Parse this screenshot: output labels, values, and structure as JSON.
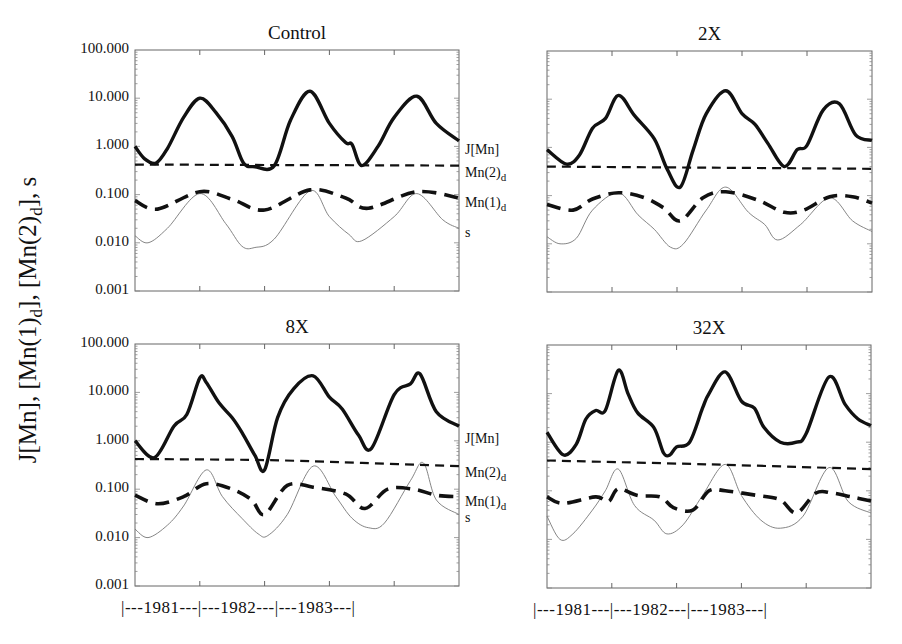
{
  "chart_data": {
    "type": "line",
    "layout": "2x2 panels, shared log y-axis, shared time x-axis",
    "ylabel": "J[Mn], [Mn(1)d], [Mn(2)d], s",
    "yscale": "log",
    "ylim": [
      0.001,
      100
    ],
    "yticks": [
      "100.000",
      "10.000",
      "1.000",
      "0.100",
      "0.010",
      "0.001"
    ],
    "ytick_values": [
      100,
      10,
      1,
      0.1,
      0.01,
      0.001
    ],
    "xlabel_segments": [
      "|---1981---",
      "|---1982---",
      "|---1983---|"
    ],
    "x_years": [
      "1981",
      "1982",
      "1983"
    ],
    "x_note": "x is fraction of the 1981–1983 span (0 = start, 1 = end)",
    "grid": false,
    "legend_position": "right edge labels at line ends",
    "series_styles": {
      "J[Mn]": "thick solid",
      "Mn(2)d": "medium dashed",
      "Mn(1)d": "thick long-dashed",
      "s": "thin solid gray"
    },
    "panels": [
      {
        "title": "Control",
        "labels": [
          "J[Mn]",
          "Mn(2)d",
          "Mn(1)d",
          "s"
        ],
        "series": [
          {
            "name": "J[Mn]",
            "x": [
              0,
              0.03,
              0.065,
              0.1,
              0.15,
              0.2,
              0.25,
              0.3,
              0.335,
              0.37,
              0.43,
              0.48,
              0.54,
              0.6,
              0.65,
              0.67,
              0.7,
              0.75,
              0.8,
              0.87,
              0.93,
              1.0
            ],
            "values": [
              1.0,
              0.55,
              0.45,
              0.9,
              4.0,
              10.0,
              5.0,
              1.6,
              0.45,
              0.38,
              0.4,
              3.5,
              14.0,
              3.0,
              1.2,
              1.1,
              0.4,
              1.0,
              4.0,
              11.0,
              3.0,
              1.3
            ]
          },
          {
            "name": "Mn(2)d",
            "x": [
              0,
              0.5,
              1.0
            ],
            "values": [
              0.42,
              0.41,
              0.4
            ]
          },
          {
            "name": "Mn(1)d",
            "x": [
              0,
              0.07,
              0.2,
              0.3,
              0.4,
              0.54,
              0.65,
              0.72,
              0.87,
              1.0
            ],
            "values": [
              0.075,
              0.05,
              0.115,
              0.08,
              0.048,
              0.125,
              0.085,
              0.052,
              0.115,
              0.085
            ]
          },
          {
            "name": "s",
            "x": [
              0,
              0.04,
              0.1,
              0.2,
              0.28,
              0.33,
              0.37,
              0.43,
              0.54,
              0.6,
              0.66,
              0.7,
              0.8,
              0.87,
              0.95,
              1.0
            ],
            "values": [
              0.014,
              0.01,
              0.02,
              0.105,
              0.025,
              0.0085,
              0.008,
              0.012,
              0.12,
              0.035,
              0.015,
              0.011,
              0.035,
              0.105,
              0.03,
              0.02
            ]
          }
        ]
      },
      {
        "title": "2X",
        "labels": [],
        "series": [
          {
            "name": "J[Mn]",
            "x": [
              0,
              0.06,
              0.1,
              0.14,
              0.18,
              0.22,
              0.27,
              0.33,
              0.37,
              0.41,
              0.45,
              0.49,
              0.55,
              0.6,
              0.64,
              0.68,
              0.73,
              0.77,
              0.8,
              0.85,
              0.9,
              0.95,
              1.0
            ],
            "values": [
              0.9,
              0.45,
              0.7,
              2.5,
              4.0,
              12.0,
              4.5,
              1.5,
              0.35,
              0.15,
              0.9,
              5.0,
              15.0,
              5.0,
              3.0,
              1.2,
              0.4,
              0.9,
              1.1,
              6.0,
              8.0,
              1.8,
              1.4
            ]
          },
          {
            "name": "Mn(2)d",
            "x": [
              0,
              0.5,
              1.0
            ],
            "values": [
              0.4,
              0.38,
              0.36
            ]
          },
          {
            "name": "Mn(1)d",
            "x": [
              0,
              0.08,
              0.14,
              0.22,
              0.3,
              0.36,
              0.41,
              0.48,
              0.55,
              0.65,
              0.73,
              0.79,
              0.87,
              0.94,
              1.0
            ],
            "values": [
              0.065,
              0.05,
              0.085,
              0.115,
              0.09,
              0.055,
              0.03,
              0.09,
              0.12,
              0.08,
              0.045,
              0.05,
              0.095,
              0.095,
              0.07
            ]
          },
          {
            "name": "s",
            "x": [
              0,
              0.04,
              0.09,
              0.14,
              0.22,
              0.28,
              0.33,
              0.38,
              0.42,
              0.49,
              0.55,
              0.62,
              0.67,
              0.71,
              0.78,
              0.87,
              0.94,
              1.0
            ],
            "values": [
              0.014,
              0.01,
              0.013,
              0.05,
              0.115,
              0.04,
              0.02,
              0.0085,
              0.01,
              0.05,
              0.15,
              0.045,
              0.025,
              0.012,
              0.025,
              0.09,
              0.03,
              0.018
            ]
          }
        ]
      },
      {
        "title": "8X",
        "labels": [
          "J[Mn]",
          "Mn(2)d",
          "Mn(1)d",
          "s"
        ],
        "series": [
          {
            "name": "J[Mn]",
            "x": [
              0,
              0.06,
              0.12,
              0.16,
              0.2,
              0.22,
              0.26,
              0.3,
              0.33,
              0.37,
              0.4,
              0.44,
              0.49,
              0.55,
              0.6,
              0.64,
              0.69,
              0.73,
              0.8,
              0.85,
              0.88,
              0.93,
              1.0
            ],
            "values": [
              1.0,
              0.45,
              2.0,
              3.5,
              20.0,
              16.0,
              6.0,
              3.0,
              1.5,
              0.5,
              0.25,
              3.0,
              12.0,
              22.0,
              8.0,
              4.5,
              1.3,
              0.7,
              9.0,
              15.0,
              24.0,
              4.0,
              2.0
            ]
          },
          {
            "name": "Mn(2)d",
            "x": [
              0,
              0.4,
              0.7,
              1.0
            ],
            "values": [
              0.42,
              0.4,
              0.35,
              0.3
            ]
          },
          {
            "name": "Mn(1)d",
            "x": [
              0,
              0.07,
              0.15,
              0.22,
              0.3,
              0.36,
              0.4,
              0.47,
              0.55,
              0.65,
              0.71,
              0.78,
              0.86,
              0.93,
              1.0
            ],
            "values": [
              0.075,
              0.05,
              0.07,
              0.13,
              0.1,
              0.06,
              0.03,
              0.12,
              0.11,
              0.08,
              0.04,
              0.1,
              0.1,
              0.075,
              0.07
            ]
          },
          {
            "name": "s",
            "x": [
              0,
              0.04,
              0.1,
              0.15,
              0.22,
              0.27,
              0.33,
              0.38,
              0.41,
              0.47,
              0.55,
              0.62,
              0.67,
              0.72,
              0.77,
              0.85,
              0.89,
              0.93,
              1.0
            ],
            "values": [
              0.015,
              0.01,
              0.018,
              0.045,
              0.25,
              0.07,
              0.025,
              0.012,
              0.011,
              0.03,
              0.3,
              0.07,
              0.025,
              0.016,
              0.02,
              0.15,
              0.35,
              0.06,
              0.03
            ]
          }
        ]
      },
      {
        "title": "32X",
        "labels": [],
        "series": [
          {
            "name": "J[Mn]",
            "x": [
              0,
              0.05,
              0.09,
              0.12,
              0.15,
              0.18,
              0.22,
              0.25,
              0.28,
              0.33,
              0.36,
              0.38,
              0.4,
              0.44,
              0.48,
              0.5,
              0.55,
              0.6,
              0.64,
              0.67,
              0.72,
              0.77,
              0.8,
              0.87,
              0.92,
              0.96,
              1.0
            ],
            "values": [
              1.6,
              0.55,
              0.9,
              3.0,
              4.5,
              4.5,
              30.0,
              10.0,
              4.0,
              2.0,
              0.6,
              0.55,
              0.8,
              1.0,
              5.0,
              10.0,
              28.0,
              7.0,
              5.0,
              2.0,
              1.0,
              1.0,
              1.5,
              22.0,
              6.0,
              3.0,
              2.2
            ]
          },
          {
            "name": "Mn(2)d",
            "x": [
              0,
              0.5,
              1.0
            ],
            "values": [
              0.42,
              0.35,
              0.28
            ]
          },
          {
            "name": "Mn(1)d",
            "x": [
              0,
              0.05,
              0.15,
              0.19,
              0.22,
              0.28,
              0.35,
              0.39,
              0.45,
              0.5,
              0.55,
              0.65,
              0.72,
              0.77,
              0.83,
              0.88,
              0.94,
              1.0
            ],
            "values": [
              0.075,
              0.055,
              0.075,
              0.06,
              0.11,
              0.08,
              0.075,
              0.045,
              0.04,
              0.1,
              0.1,
              0.08,
              0.065,
              0.035,
              0.09,
              0.09,
              0.075,
              0.062
            ]
          },
          {
            "name": "s",
            "x": [
              0,
              0.04,
              0.08,
              0.14,
              0.18,
              0.22,
              0.27,
              0.33,
              0.37,
              0.42,
              0.48,
              0.55,
              0.6,
              0.66,
              0.72,
              0.79,
              0.87,
              0.93,
              1.0
            ],
            "values": [
              0.03,
              0.01,
              0.013,
              0.04,
              0.1,
              0.28,
              0.05,
              0.025,
              0.013,
              0.02,
              0.08,
              0.35,
              0.08,
              0.025,
              0.017,
              0.03,
              0.3,
              0.06,
              0.035
            ]
          }
        ]
      }
    ]
  },
  "panels_meta": [
    {
      "title": "Control",
      "left": 135,
      "top": 50,
      "width": 324,
      "height": 241,
      "show_yticks": true,
      "show_labels": true,
      "show_years": false
    },
    {
      "title": "2X",
      "left": 547,
      "top": 51,
      "width": 325,
      "height": 241,
      "show_yticks": false,
      "show_labels": false,
      "show_years": false
    },
    {
      "title": "8X",
      "left": 135,
      "top": 344,
      "width": 324,
      "height": 242,
      "show_yticks": true,
      "show_labels": true,
      "show_years": true
    },
    {
      "title": "32X",
      "left": 547,
      "top": 345,
      "width": 324,
      "height": 243,
      "show_yticks": false,
      "show_labels": false,
      "show_years": true
    }
  ],
  "year_axis_text": "|---1981---|---1982---|---1983---|",
  "ylabel_parts": {
    "a": "J[Mn], [Mn(1)",
    "a_sub": "d",
    "b": "], [Mn(2)",
    "b_sub": "d",
    "c": "], s"
  }
}
